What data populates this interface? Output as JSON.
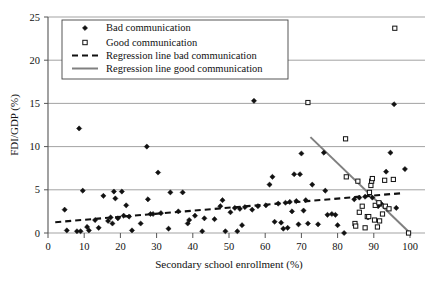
{
  "chart_data": {
    "type": "scatter",
    "title": "",
    "xlabel": "Secondary school enrollment (%)",
    "ylabel": "FDI/GDP (%)",
    "xlim": [
      0,
      100
    ],
    "ylim": [
      0,
      25
    ],
    "xticks": [
      0,
      10,
      20,
      30,
      40,
      50,
      60,
      70,
      80,
      90,
      100
    ],
    "yticks": [
      0,
      5,
      10,
      15,
      20,
      25
    ],
    "grid": "horizontal",
    "legend_position": "top-left",
    "legend": [
      {
        "key": "bad-points",
        "label": "Bad communication",
        "marker": "filled-diamond",
        "color": "#111111"
      },
      {
        "key": "good-points",
        "label": "Good communication",
        "marker": "open-square",
        "color": "#111111"
      },
      {
        "key": "bad-regression",
        "label": "Regression line bad communication",
        "marker": "dashed-line",
        "color": "#111111"
      },
      {
        "key": "good-regression",
        "label": "Regression line good communication",
        "marker": "solid-line",
        "color": "#808080"
      }
    ],
    "series": [
      {
        "name": "Bad communication",
        "marker": "filled-diamond",
        "color": "#111111",
        "points": [
          [
            4.6,
            2.7
          ],
          [
            5.2,
            0.3
          ],
          [
            8.0,
            0.2
          ],
          [
            8.6,
            12.1
          ],
          [
            9.0,
            0.2
          ],
          [
            9.6,
            4.9
          ],
          [
            10.8,
            0.7
          ],
          [
            11.3,
            0.3
          ],
          [
            13.0,
            1.5
          ],
          [
            14.0,
            0.6
          ],
          [
            15.3,
            4.3
          ],
          [
            16.6,
            1.4
          ],
          [
            17.3,
            1.8
          ],
          [
            17.8,
            1.1
          ],
          [
            18.2,
            4.8
          ],
          [
            18.6,
            4.0
          ],
          [
            19.3,
            1.7
          ],
          [
            20.4,
            4.8
          ],
          [
            20.9,
            2.0
          ],
          [
            21.6,
            3.2
          ],
          [
            22.4,
            1.9
          ],
          [
            23.2,
            0.3
          ],
          [
            25.6,
            1.1
          ],
          [
            27.3,
            10.0
          ],
          [
            27.6,
            3.9
          ],
          [
            28.3,
            2.2
          ],
          [
            29.0,
            2.2
          ],
          [
            30.4,
            7.0
          ],
          [
            31.2,
            2.3
          ],
          [
            33.3,
            0.5
          ],
          [
            33.8,
            4.7
          ],
          [
            36.0,
            2.5
          ],
          [
            37.2,
            4.7
          ],
          [
            38.6,
            1.1
          ],
          [
            39.0,
            1.5
          ],
          [
            40.6,
            2.0
          ],
          [
            42.6,
            0.2
          ],
          [
            43.2,
            1.7
          ],
          [
            46.0,
            1.6
          ],
          [
            47.6,
            3.1
          ],
          [
            48.2,
            3.8
          ],
          [
            49.0,
            0.2
          ],
          [
            50.4,
            2.4
          ],
          [
            51.6,
            2.9
          ],
          [
            52.3,
            0.2
          ],
          [
            53.0,
            2.8
          ],
          [
            53.6,
            0.9
          ],
          [
            54.4,
            3.0
          ],
          [
            56.4,
            2.7
          ],
          [
            56.9,
            15.3
          ],
          [
            58.0,
            3.1
          ],
          [
            60.2,
            3.2
          ],
          [
            61.2,
            5.6
          ],
          [
            62.0,
            6.5
          ],
          [
            62.6,
            1.3
          ],
          [
            63.6,
            3.4
          ],
          [
            64.4,
            1.2
          ],
          [
            65.0,
            0.5
          ],
          [
            65.6,
            3.5
          ],
          [
            66.2,
            0.6
          ],
          [
            66.8,
            3.6
          ],
          [
            67.4,
            2.5
          ],
          [
            68.0,
            6.8
          ],
          [
            68.6,
            3.7
          ],
          [
            69.2,
            1.0
          ],
          [
            69.6,
            6.8
          ],
          [
            70.0,
            9.2
          ],
          [
            70.6,
            2.6
          ],
          [
            71.2,
            3.8
          ],
          [
            71.8,
            1.1
          ],
          [
            73.0,
            5.6
          ],
          [
            74.6,
            1.0
          ],
          [
            76.2,
            9.3
          ],
          [
            76.6,
            4.9
          ],
          [
            77.2,
            2.1
          ],
          [
            78.4,
            2.2
          ],
          [
            79.4,
            2.1
          ],
          [
            80.0,
            0.9
          ],
          [
            81.8,
            0.0
          ],
          [
            84.6,
            3.9
          ],
          [
            86.0,
            4.1
          ],
          [
            87.6,
            4.2
          ],
          [
            88.4,
            1.8
          ],
          [
            89.6,
            4.1
          ],
          [
            91.2,
            3.1
          ],
          [
            92.0,
            3.4
          ],
          [
            93.4,
            7.1
          ],
          [
            94.6,
            9.3
          ],
          [
            95.6,
            14.9
          ],
          [
            96.2,
            2.9
          ],
          [
            98.6,
            7.4
          ]
        ]
      },
      {
        "name": "Good communication",
        "marker": "open-square",
        "color": "#111111",
        "points": [
          [
            71.8,
            15.1
          ],
          [
            82.2,
            10.9
          ],
          [
            82.4,
            6.5
          ],
          [
            84.8,
            1.1
          ],
          [
            85.0,
            0.8
          ],
          [
            85.6,
            6.0
          ],
          [
            86.0,
            2.4
          ],
          [
            86.8,
            3.1
          ],
          [
            87.6,
            0.6
          ],
          [
            88.2,
            1.9
          ],
          [
            88.6,
            1.9
          ],
          [
            88.8,
            4.7
          ],
          [
            89.2,
            5.5
          ],
          [
            89.4,
            6.0
          ],
          [
            89.6,
            6.3
          ],
          [
            90.2,
            1.5
          ],
          [
            90.4,
            3.2
          ],
          [
            91.0,
            0.7
          ],
          [
            91.4,
            3.5
          ],
          [
            91.6,
            1.4
          ],
          [
            92.4,
            2.2
          ],
          [
            93.0,
            6.1
          ],
          [
            93.2,
            3.1
          ],
          [
            94.2,
            2.8
          ],
          [
            95.4,
            6.2
          ],
          [
            95.8,
            23.7
          ],
          [
            99.6,
            0.0
          ]
        ]
      }
    ],
    "regression_lines": [
      {
        "name": "Regression line bad communication",
        "style": "dashed",
        "color": "#111111",
        "x_start": 2.0,
        "y_start": 1.25,
        "x_end": 97.5,
        "y_end": 4.6
      },
      {
        "name": "Regression line good communication",
        "style": "solid",
        "color": "#808080",
        "x_start": 72.5,
        "y_start": 11.1,
        "x_end": 100.0,
        "y_end": 0.0
      }
    ]
  }
}
